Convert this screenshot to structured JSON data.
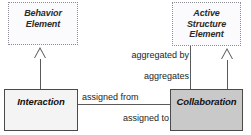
{
  "diagram": {
    "type": "uml-class-metamodel",
    "width": 251,
    "height": 135,
    "background": "#ffffff"
  },
  "nodes": [
    {
      "id": "behavior-element",
      "label": "Behavior\nElement",
      "line1": "Behavior",
      "line2": "Element",
      "style": "abstract",
      "border": "dotted",
      "fill": "#fbfbfd",
      "x": 8,
      "y": 2,
      "w": 70,
      "h": 43
    },
    {
      "id": "active-structure-element",
      "label": "Active\nStructure\nElement",
      "line1": "Active",
      "line2": "Structure",
      "line3": "Element",
      "style": "abstract",
      "border": "dotted",
      "fill": "#fbfbfd",
      "x": 172,
      "y": 2,
      "w": 69,
      "h": 44
    },
    {
      "id": "interaction",
      "label": "Interaction",
      "style": "concrete",
      "border": "solid",
      "fill": "#f4f4f4",
      "x": 4,
      "y": 89,
      "w": 74,
      "h": 42
    },
    {
      "id": "collaboration",
      "label": "Collaboration",
      "style": "concrete",
      "border": "solid",
      "fill": "#c9c9c9",
      "x": 170,
      "y": 89,
      "w": 73,
      "h": 42
    }
  ],
  "edges": [
    {
      "id": "interaction-generalizes-behavior-element",
      "kind": "generalization",
      "from": "interaction",
      "to": "behavior-element",
      "label": ""
    },
    {
      "id": "collaboration-generalizes-active-structure-element",
      "kind": "generalization",
      "from": "collaboration",
      "to": "active-structure-element",
      "label": ""
    },
    {
      "id": "collaboration-aggregates-active-structure-element",
      "kind": "aggregation",
      "from": "collaboration",
      "to": "active-structure-element",
      "label_upper": "aggregated by",
      "label_lower": "aggregates"
    },
    {
      "id": "interaction-assigned-collaboration",
      "kind": "association",
      "from": "interaction",
      "to": "collaboration",
      "label_upper": "assigned from",
      "label_lower": "assigned to"
    }
  ],
  "labels": {
    "aggregated_by": "aggregated by",
    "aggregates": "aggregates",
    "assigned_from": "assigned from",
    "assigned_to": "assigned to"
  },
  "colors": {
    "line": "#5a5a5a",
    "abstract_border": "#8e8e96",
    "concrete_border": "#4a4a4a",
    "abstract_fill": "#fbfbfd",
    "interaction_fill": "#f4f4f4",
    "collaboration_fill": "#c9c9c9",
    "text": "#1d1d1d"
  }
}
